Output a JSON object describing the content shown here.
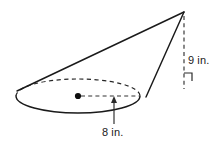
{
  "figure": {
    "kind": "oblique-cone-diagram",
    "background_color": "#ffffff",
    "line_color": "#1a1a1a",
    "dash_color": "#262626",
    "label_color": "#1a1a1a"
  },
  "labels": {
    "height": "9 in.",
    "radius": "8 in."
  },
  "measurements": {
    "height_value": 9,
    "height_unit": "in.",
    "radius_value": 8,
    "radius_unit": "in."
  },
  "geometry": {
    "base_center": {
      "x": 78,
      "y": 96
    },
    "base_rx": 62,
    "base_ry": 17,
    "apex": {
      "x": 184,
      "y": 12
    },
    "left_slant_start": {
      "x": 17,
      "y": 91
    },
    "right_slant_start": {
      "x": 146,
      "y": 97
    },
    "height_line_x": 184,
    "height_line_top_y": 16,
    "height_line_bottom_y": 89,
    "right_angle_corner": {
      "x": 184,
      "y": 80
    },
    "radius_leader_x": 114,
    "radius_leader_bottom_y": 124,
    "radius_dash_end_x": 140
  },
  "annotations": {
    "base_back_arc_style": "dashed",
    "base_front_arc_style": "solid",
    "height_line_style": "dashed",
    "radius_line_style": "dashed",
    "right_angle_marker": true,
    "center_dot": true
  }
}
